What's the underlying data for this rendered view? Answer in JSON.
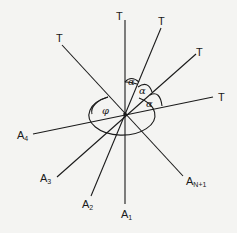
{
  "diagram": {
    "type": "angular-line-arrangement",
    "background": "#f4f4f2",
    "line_color": "#1a1a1a",
    "center": {
      "x": 125,
      "y": 114
    },
    "lines": [
      {
        "id": "line-1",
        "top_label": "T",
        "bottom_label": "A",
        "bottom_sub": "1"
      },
      {
        "id": "line-2",
        "top_label": "T",
        "bottom_label": "A",
        "bottom_sub": "2"
      },
      {
        "id": "line-3",
        "top_label": "T",
        "bottom_label": "A",
        "bottom_sub": "3"
      },
      {
        "id": "line-4",
        "top_label": "T",
        "bottom_label": "A",
        "bottom_sub": "4"
      },
      {
        "id": "line-5",
        "top_label": "T",
        "bottom_label": "A",
        "bottom_sub": "N+1"
      }
    ],
    "angle_labels": [
      "α",
      "α",
      "α"
    ],
    "phi_label": "φ"
  }
}
